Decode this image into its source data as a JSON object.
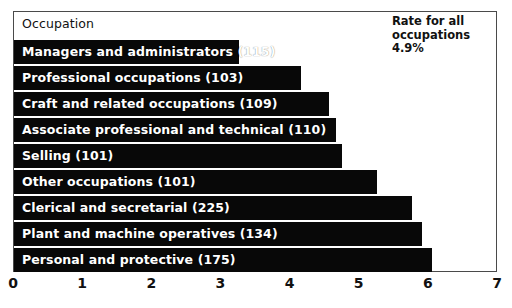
{
  "chart_data": {
    "type": "bar",
    "orientation": "horizontal",
    "title": "",
    "column_header": "Occupation",
    "xlabel": "",
    "ylabel": "",
    "xlim": [
      0,
      7
    ],
    "xticks": [
      0,
      1,
      2,
      3,
      4,
      5,
      6,
      7
    ],
    "xtick_labels": [
      "0",
      "1",
      "2",
      "3",
      "4",
      "5",
      "6",
      "7"
    ],
    "grid": false,
    "legend": "none",
    "bar_color": "#080808",
    "bar_label_color": "#ffffff",
    "frame_color": "#4a4a4a",
    "categories": [
      "Managers and administrators (115)",
      "Professional occupations (103)",
      "Craft and related occupations (109)",
      "Associate professional and technical (110)",
      "Selling (101)",
      "Other occupations (101)",
      "Clerical and secretarial (225)",
      "Plant and machine operatives (134)",
      "Personal and protective (175)"
    ],
    "values": [
      3.25,
      4.15,
      4.55,
      4.65,
      4.75,
      5.25,
      5.75,
      5.9,
      6.05
    ],
    "annotations": [
      {
        "name": "rate-for-all-occupations",
        "lines": [
          "Rate for all",
          "occupations",
          "4.9%"
        ],
        "value": "4.9%"
      }
    ]
  },
  "axis": {
    "ticks": [
      {
        "label": "0",
        "value": 0
      },
      {
        "label": "1",
        "value": 1
      },
      {
        "label": "2",
        "value": 2
      },
      {
        "label": "3",
        "value": 3
      },
      {
        "label": "4",
        "value": 4
      },
      {
        "label": "5",
        "value": 5
      },
      {
        "label": "6",
        "value": 6
      },
      {
        "label": "7",
        "value": 7
      }
    ]
  },
  "header": {
    "column_label": "Occupation"
  },
  "note": {
    "line1": "Rate for all",
    "line2": "occupations",
    "line3": "4.9%"
  }
}
